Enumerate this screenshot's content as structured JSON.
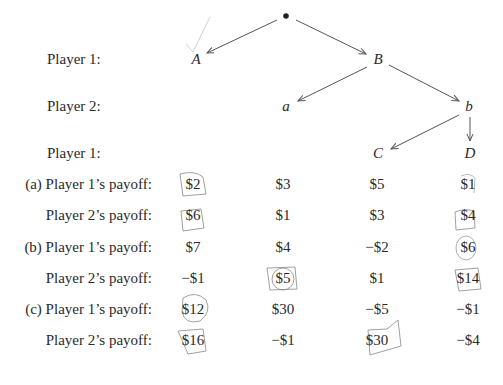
{
  "tree": {
    "row_labels": [
      "Player 1:",
      "Player 2:",
      "Player 1:"
    ],
    "nodes": {
      "A": "A",
      "B": "B",
      "a": "a",
      "b": "b",
      "C": "C",
      "D": "D"
    }
  },
  "payoffs": {
    "rows": [
      {
        "label": "(a) Player 1’s payoff:",
        "values": [
          "$2",
          "$3",
          "$5",
          "$1"
        ]
      },
      {
        "label": "Player 2’s payoff:",
        "values": [
          "$6",
          "$1",
          "$3",
          "$4"
        ]
      },
      {
        "label": "(b) Player 1’s payoff:",
        "values": [
          "$7",
          "$4",
          "−$2",
          "$6"
        ]
      },
      {
        "label": "Player 2’s payoff:",
        "values": [
          "−$1",
          "$5",
          "$1",
          "$14"
        ]
      },
      {
        "label": "(c) Player 1’s payoff:",
        "values": [
          "$12",
          "$30",
          "−$5",
          "−$1"
        ]
      },
      {
        "label": "Player 2’s payoff:",
        "values": [
          "$16",
          "−$1",
          "$30",
          "−$4"
        ]
      }
    ]
  },
  "annotations": {
    "ink_color": "#9a9a9a",
    "checkmark_near": "A"
  }
}
